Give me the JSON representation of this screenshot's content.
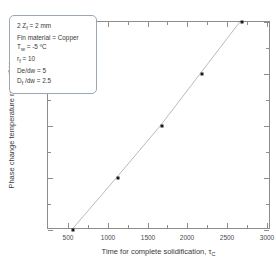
{
  "chart_data": {
    "type": "scatter",
    "title": "",
    "xlabel": "Time for complete solidification, τ_C",
    "ylabel": "Phase change temperature range [ºC]",
    "xlim": [
      250,
      3050
    ],
    "ylim": [
      0.1,
      0.5
    ],
    "grid": false,
    "legend": "none",
    "x_ticks": [
      500,
      1000,
      1500,
      2000,
      2500,
      3000
    ],
    "x_tick_labels": [
      "500",
      "1000",
      "1500",
      "2000",
      "2500",
      "3000"
    ],
    "y_ticks": [
      0.1,
      0.2,
      0.3,
      0.4,
      0.5
    ],
    "y_tick_labels": [
      "0.10",
      "0.20",
      "0.30",
      "0.40",
      "0.50"
    ],
    "minor_ticks": true,
    "series": [
      {
        "name": "solidification time vs phase change temperature range",
        "marker": "triangle",
        "line": "solid",
        "color": "#1a1a1a",
        "x": [
          570,
          1130,
          1680,
          2180,
          2680
        ],
        "y": [
          0.1,
          0.2,
          0.3,
          0.4,
          0.5
        ]
      }
    ],
    "annotations": [
      "2 Z_f = 2 mm",
      "Fin material  = Copper",
      "T_w = -5 ºC",
      "r_f = 10",
      "De/dw = 5",
      "D_f /dw = 2.5"
    ]
  },
  "axis": {
    "x_title_main": "Time for complete solidification, ",
    "x_title_symbol": "τ",
    "x_title_sub": "C",
    "y_title": "Phase change temperature range [ºC]"
  },
  "notes": {
    "line1_a": "2 Z",
    "line1_sub": "f",
    "line1_b": " = 2 mm",
    "line2": "Fin material  = Copper",
    "line3_a": "T",
    "line3_sub": "w",
    "line3_b": " = -5 ºC",
    "line4_a": "r",
    "line4_sub": "f",
    "line4_b": " = 10",
    "line5": "De/dw = 5",
    "line6_a": "D",
    "line6_sub": "f",
    "line6_b": " /dw = 2.5"
  },
  "colors": {
    "marker": "#1a1a1a",
    "line": "#b9b9b9",
    "frame": "#8c8c8c",
    "box_border": "#9aa7b4",
    "text": "#3a3a3a"
  }
}
